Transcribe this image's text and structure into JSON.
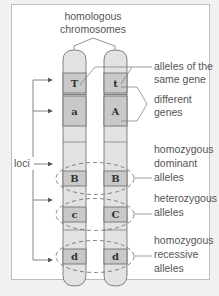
{
  "title": "homologous chromosomes",
  "title_lines": [
    "homologous",
    "chromosomes"
  ],
  "left_label": "loci",
  "colors": {
    "background": "#f1f1ef",
    "panel": "#ffffff",
    "chromosome_fill": "#e2e2e2",
    "band_fill": "#c9c9c9",
    "outline": "#666666",
    "text": "#555555"
  },
  "chromosomes": {
    "left": {
      "alleles": [
        "T",
        "a",
        "B",
        "c",
        "d"
      ]
    },
    "right": {
      "alleles": [
        "t",
        "A",
        "B",
        "C",
        "d"
      ]
    }
  },
  "annotations": [
    {
      "id": "alleles-same-gene",
      "lines": [
        "alleles of the",
        "same gene"
      ]
    },
    {
      "id": "different-genes",
      "lines": [
        "different",
        "genes"
      ]
    },
    {
      "id": "homozygous-dominant",
      "lines": [
        "homozygous",
        "dominant",
        "alleles"
      ]
    },
    {
      "id": "heterozygous",
      "lines": [
        "heterozygous",
        "alleles"
      ]
    },
    {
      "id": "homozygous-recessive",
      "lines": [
        "homozygous",
        "recessive",
        "alleles"
      ]
    }
  ]
}
